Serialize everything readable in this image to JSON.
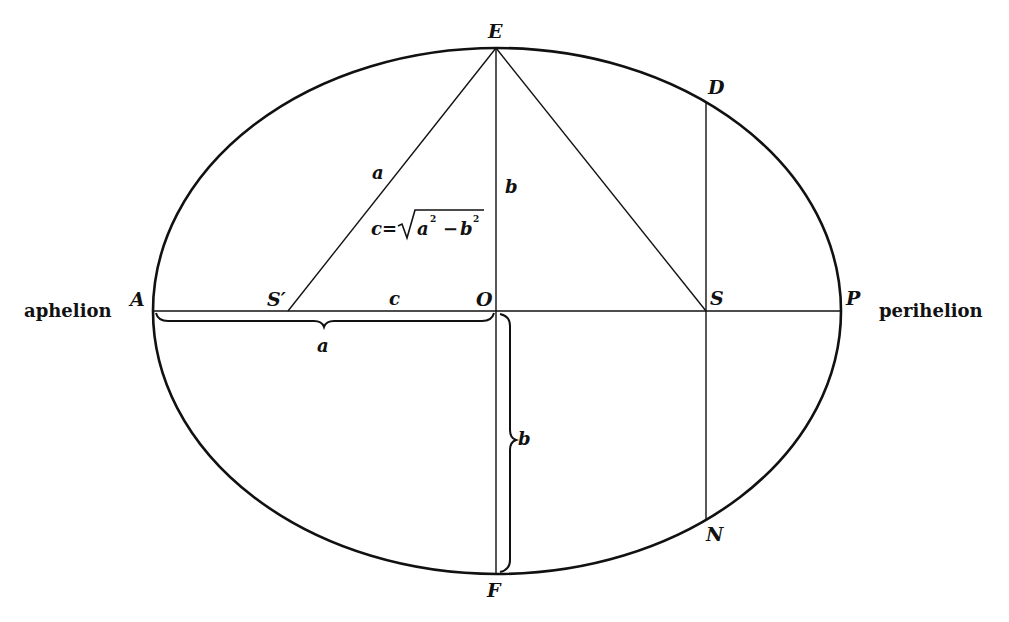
{
  "diagram": {
    "colors": {
      "ink": "#111111",
      "background": "#ffffff"
    },
    "points": {
      "A": "A",
      "P": "P",
      "E": "E",
      "F": "F",
      "O": "O",
      "S": "S",
      "S_prime": "S′",
      "D": "D",
      "N": "N"
    },
    "words": {
      "aphelion": "aphelion",
      "perihelion": "perihelion"
    },
    "segment_labels": {
      "a_upper": "a",
      "b_upper": "b",
      "c_axis": "c",
      "a_brace": "a",
      "b_brace": "b"
    },
    "formula": {
      "lhs": "c",
      "equals": "=",
      "radical": "√",
      "a": "a",
      "exp1": "2",
      "minus": "−",
      "b": "b",
      "exp2": "2"
    }
  }
}
